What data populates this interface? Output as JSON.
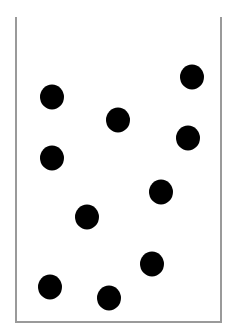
{
  "diagram": {
    "container": {
      "shape": "open-top-box",
      "border_color": "#9a9a9a"
    },
    "dots": {
      "color": "#000000",
      "width": 24,
      "height": 25,
      "count": 10,
      "items": [
        {
          "x": 52,
          "y": 97
        },
        {
          "x": 192,
          "y": 77
        },
        {
          "x": 118,
          "y": 120
        },
        {
          "x": 188,
          "y": 138
        },
        {
          "x": 52,
          "y": 158
        },
        {
          "x": 161,
          "y": 192
        },
        {
          "x": 87,
          "y": 217
        },
        {
          "x": 152,
          "y": 264
        },
        {
          "x": 50,
          "y": 287
        },
        {
          "x": 109,
          "y": 298
        }
      ]
    }
  }
}
